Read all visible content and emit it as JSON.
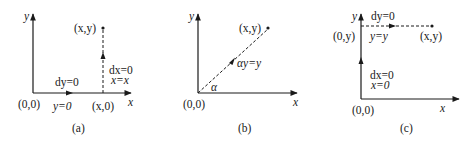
{
  "panels": [
    {
      "id": "a",
      "caption": "(a)",
      "axis_x": "x",
      "axis_y": "y",
      "origin": "(0,0)",
      "point": "(x,y)",
      "foot_point": "(x,0)",
      "path1_label_top": "dy=0",
      "path1_label_bottom": "y=0",
      "path2_label_top": "dx=0",
      "path2_label_bottom": "x=x"
    },
    {
      "id": "b",
      "caption": "(b)",
      "axis_x": "x",
      "axis_y": "y",
      "origin": "(0,0)",
      "point": "(x,y)",
      "path_label": "αy=y",
      "angle_label": "α"
    },
    {
      "id": "c",
      "caption": "(c)",
      "axis_x": "x",
      "axis_y": "y",
      "origin": "(0,0)",
      "point": "(x,y)",
      "foot_point": "(0,y)",
      "path1_label_top": "dx=0",
      "path1_label_bottom": "x=0",
      "path2_label_top": "dy=0",
      "path2_label_bottom": "y=y"
    }
  ]
}
